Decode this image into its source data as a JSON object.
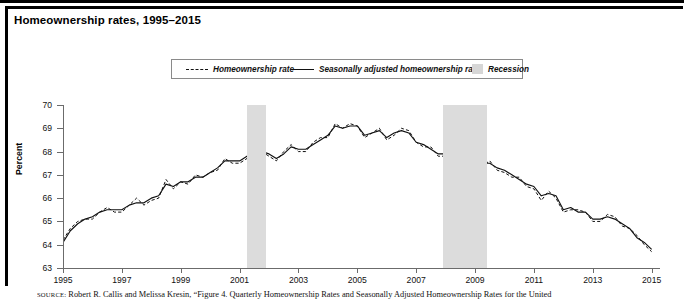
{
  "title": "Homeownership rates, 1995–2015",
  "legend": {
    "items": [
      {
        "label": "Homeownership rate",
        "style": "dashed"
      },
      {
        "label": "Seasonally adjusted homeownership rate",
        "style": "solid"
      },
      {
        "label": "Recession",
        "style": "swatch"
      }
    ]
  },
  "axes": {
    "ylabel": "Percent",
    "yticks": [
      "70",
      "69",
      "68",
      "67",
      "66",
      "65",
      "64",
      "63"
    ],
    "xticks": [
      "1995",
      "1997",
      "1999",
      "2001",
      "2003",
      "2005",
      "2007",
      "2009",
      "2011",
      "2013",
      "2015"
    ]
  },
  "source": {
    "prefix": "SOURCE:",
    "text": " Robert R. Callis and Melissa Kresin, “Figure 4. Quarterly Homeownership Rates and Seasonally Adjusted Homeownership Rates for the United"
  },
  "colors": {
    "recession_band": "#dcdcdc",
    "line": "#111111",
    "axis": "#6b6b6b",
    "frame": "#000000"
  },
  "chart_data": {
    "type": "line",
    "title": "Homeownership rates, 1995–2015",
    "xlabel": "",
    "ylabel": "Percent",
    "xlim": [
      1995.0,
      2015.25
    ],
    "ylim": [
      63,
      70
    ],
    "grid": false,
    "legend_position": "top",
    "recessions": [
      {
        "start": 2001.25,
        "end": 2001.9,
        "label": "Recession"
      },
      {
        "start": 2007.9,
        "end": 2009.4,
        "label": "Recession"
      }
    ],
    "x": [
      1995.0,
      1995.25,
      1995.5,
      1995.75,
      1996.0,
      1996.25,
      1996.5,
      1996.75,
      1997.0,
      1997.25,
      1997.5,
      1997.75,
      1998.0,
      1998.25,
      1998.5,
      1998.75,
      1999.0,
      1999.25,
      1999.5,
      1999.75,
      2000.0,
      2000.25,
      2000.5,
      2000.75,
      2001.0,
      2001.25,
      2001.5,
      2001.75,
      2002.0,
      2002.25,
      2002.5,
      2002.75,
      2003.0,
      2003.25,
      2003.5,
      2003.75,
      2004.0,
      2004.25,
      2004.5,
      2004.75,
      2005.0,
      2005.25,
      2005.5,
      2005.75,
      2006.0,
      2006.25,
      2006.5,
      2006.75,
      2007.0,
      2007.25,
      2007.5,
      2007.75,
      2008.0,
      2008.25,
      2008.5,
      2008.75,
      2009.0,
      2009.25,
      2009.5,
      2009.75,
      2010.0,
      2010.25,
      2010.5,
      2010.75,
      2011.0,
      2011.25,
      2011.5,
      2011.75,
      2012.0,
      2012.25,
      2012.5,
      2012.75,
      2013.0,
      2013.25,
      2013.5,
      2013.75,
      2014.0,
      2014.25,
      2014.5,
      2014.75,
      2015.0
    ],
    "series": [
      {
        "name": "Homeownership rate",
        "style": "dashed",
        "values": [
          64.2,
          64.7,
          65.0,
          65.1,
          65.1,
          65.4,
          65.6,
          65.4,
          65.4,
          65.7,
          66.0,
          65.7,
          65.9,
          66.0,
          66.8,
          66.4,
          66.7,
          66.6,
          67.0,
          66.9,
          67.1,
          67.2,
          67.7,
          67.5,
          67.5,
          67.7,
          68.1,
          68.0,
          67.8,
          67.6,
          68.0,
          68.3,
          68.0,
          68.0,
          68.4,
          68.6,
          68.6,
          69.2,
          69.0,
          69.2,
          69.1,
          68.6,
          68.8,
          69.0,
          68.5,
          68.7,
          69.0,
          68.9,
          68.4,
          68.2,
          68.2,
          67.8,
          67.8,
          68.1,
          67.9,
          67.5,
          67.3,
          67.4,
          67.6,
          67.2,
          67.1,
          66.9,
          66.9,
          66.5,
          66.4,
          65.9,
          66.3,
          66.0,
          65.4,
          65.5,
          65.5,
          65.4,
          65.0,
          65.0,
          65.3,
          65.2,
          64.8,
          64.7,
          64.4,
          64.0,
          63.7
        ]
      },
      {
        "name": "Seasonally adjusted homeownership rate",
        "style": "solid",
        "values": [
          64.1,
          64.6,
          64.9,
          65.1,
          65.2,
          65.4,
          65.5,
          65.5,
          65.5,
          65.7,
          65.8,
          65.8,
          66.0,
          66.1,
          66.6,
          66.5,
          66.7,
          66.7,
          66.9,
          66.9,
          67.1,
          67.3,
          67.6,
          67.6,
          67.6,
          67.8,
          68.0,
          68.0,
          67.9,
          67.7,
          67.9,
          68.2,
          68.1,
          68.1,
          68.3,
          68.5,
          68.7,
          69.1,
          69.0,
          69.1,
          69.1,
          68.7,
          68.8,
          68.9,
          68.6,
          68.8,
          68.9,
          68.8,
          68.4,
          68.3,
          68.1,
          67.9,
          67.9,
          68.0,
          67.8,
          67.6,
          67.4,
          67.5,
          67.5,
          67.3,
          67.2,
          67.0,
          66.8,
          66.6,
          66.5,
          66.1,
          66.2,
          66.1,
          65.5,
          65.6,
          65.4,
          65.4,
          65.1,
          65.1,
          65.2,
          65.1,
          64.9,
          64.7,
          64.3,
          64.1,
          63.8
        ]
      }
    ]
  }
}
